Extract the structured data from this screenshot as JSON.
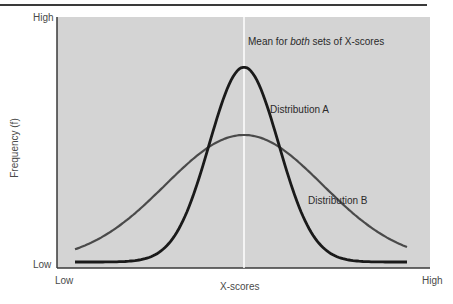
{
  "chart_data": {
    "type": "line",
    "title": "",
    "xlabel": "X-scores",
    "ylabel": "Frequency (f)",
    "x_tick_labels": [
      "Low",
      "High"
    ],
    "y_tick_labels": [
      "Low",
      "High"
    ],
    "grid": false,
    "legend": "none (direct labels on curves)",
    "annotations": {
      "mean_line": "Mean for both sets of X-scores",
      "mean_prefix": "Mean for ",
      "mean_emph": "both",
      "mean_suffix": " sets of X-scores"
    },
    "series": [
      {
        "name": "Distribution A",
        "shape": "normal",
        "mean": 0,
        "sd": 0.55,
        "relative_peak": 0.8,
        "color": "#1a1a1a"
      },
      {
        "name": "Distribution B",
        "shape": "normal",
        "mean": 0,
        "sd": 1.25,
        "relative_peak": 0.53,
        "color": "#4a4a4a"
      }
    ],
    "x_range": [
      "Low",
      "High"
    ],
    "y_range": [
      "Low",
      "High"
    ]
  },
  "colors": {
    "plot_background": "#d4d4d4",
    "axis": "#3a3a3a",
    "mean_line": "#ffffff",
    "curve_a": "#1a1a1a",
    "curve_b": "#4a4a4a"
  }
}
